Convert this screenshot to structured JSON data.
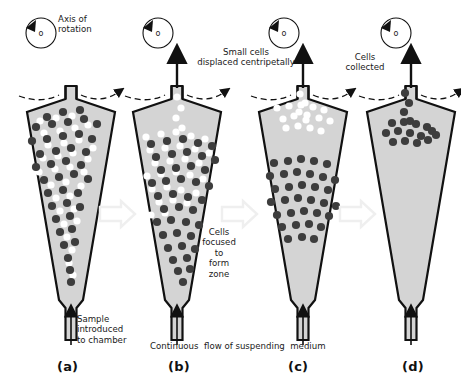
{
  "figure": {
    "title_present": false,
    "background_color": "#ffffff",
    "chamber_fill": "#d4d4d4",
    "chamber_stroke": "#111111",
    "dark_cell_color": "#3d3d3d",
    "light_cell_color": "#ffffff",
    "transition_arrow_color": "#efefef",
    "text_color": "#1a1a1a"
  },
  "rotation_icon": {
    "name": "axis-of-rotation-icon",
    "center_mark": "o",
    "direction": "counterclockwise"
  },
  "annotations": {
    "axis_of_rotation": "Axis of\nrotation",
    "small_cells": "Small cells\ndisplaced centripetally",
    "cells_focused": "Cells\nfocused\nto\nform\nzone",
    "cells_collected": "Cells\ncollected",
    "sample_introduced": "Sample\nintroduced\nto chamber",
    "continuous_flow": "Continuous  flow of suspending  medium"
  },
  "panels": [
    {
      "id": "a",
      "label": "(a)",
      "caption": "Sample introduced to chamber",
      "dark_cells": [
        [
          47,
          117
        ],
        [
          63,
          112
        ],
        [
          80,
          110
        ],
        [
          36,
          127
        ],
        [
          52,
          124
        ],
        [
          68,
          122
        ],
        [
          84,
          119
        ],
        [
          97,
          124
        ],
        [
          32,
          141
        ],
        [
          47,
          139
        ],
        [
          63,
          136
        ],
        [
          79,
          134
        ],
        [
          92,
          139
        ],
        [
          40,
          154
        ],
        [
          56,
          151
        ],
        [
          71,
          148
        ],
        [
          86,
          152
        ],
        [
          36,
          167
        ],
        [
          51,
          164
        ],
        [
          66,
          161
        ],
        [
          81,
          165
        ],
        [
          44,
          180
        ],
        [
          59,
          177
        ],
        [
          74,
          174
        ],
        [
          88,
          179
        ],
        [
          48,
          193
        ],
        [
          63,
          190
        ],
        [
          78,
          193
        ],
        [
          52,
          206
        ],
        [
          67,
          203
        ],
        [
          80,
          207
        ],
        [
          56,
          219
        ],
        [
          70,
          216
        ],
        [
          60,
          232
        ],
        [
          72,
          229
        ],
        [
          64,
          245
        ],
        [
          75,
          242
        ],
        [
          68,
          258
        ],
        [
          70,
          270
        ],
        [
          71,
          282
        ]
      ],
      "light_cells": [
        [
          40,
          121
        ],
        [
          56,
          118
        ],
        [
          72,
          116
        ],
        [
          88,
          125
        ],
        [
          44,
          133
        ],
        [
          60,
          131
        ],
        [
          75,
          128
        ],
        [
          28,
          148
        ],
        [
          48,
          145
        ],
        [
          64,
          143
        ],
        [
          79,
          140
        ],
        [
          93,
          148
        ],
        [
          43,
          158
        ],
        [
          58,
          156
        ],
        [
          73,
          153
        ],
        [
          88,
          159
        ],
        [
          39,
          172
        ],
        [
          55,
          169
        ],
        [
          70,
          167
        ],
        [
          84,
          172
        ],
        [
          51,
          185
        ],
        [
          66,
          182
        ],
        [
          81,
          186
        ],
        [
          56,
          198
        ],
        [
          70,
          196
        ],
        [
          60,
          211
        ],
        [
          74,
          209
        ],
        [
          64,
          224
        ],
        [
          77,
          221
        ],
        [
          67,
          237
        ],
        [
          72,
          250
        ],
        [
          69,
          263
        ],
        [
          73,
          275
        ]
      ]
    },
    {
      "id": "b",
      "label": "(b)",
      "caption": "Continuous flow of suspending medium",
      "dark_cells": [
        [
          151,
          144
        ],
        [
          167,
          141
        ],
        [
          183,
          139
        ],
        [
          198,
          143
        ],
        [
          212,
          146
        ],
        [
          156,
          157
        ],
        [
          172,
          154
        ],
        [
          187,
          152
        ],
        [
          202,
          156
        ],
        [
          215,
          160
        ],
        [
          161,
          170
        ],
        [
          176,
          168
        ],
        [
          191,
          166
        ],
        [
          205,
          170
        ],
        [
          152,
          183
        ],
        [
          166,
          181
        ],
        [
          181,
          179
        ],
        [
          196,
          182
        ],
        [
          209,
          186
        ],
        [
          158,
          196
        ],
        [
          173,
          194
        ],
        [
          188,
          197
        ],
        [
          202,
          200
        ],
        [
          164,
          209
        ],
        [
          179,
          207
        ],
        [
          193,
          210
        ],
        [
          157,
          222
        ],
        [
          171,
          220
        ],
        [
          186,
          222
        ],
        [
          199,
          225
        ],
        [
          163,
          235
        ],
        [
          177,
          233
        ],
        [
          191,
          236
        ],
        [
          168,
          248
        ],
        [
          182,
          246
        ],
        [
          195,
          249
        ],
        [
          173,
          260
        ],
        [
          187,
          258
        ],
        [
          178,
          271
        ],
        [
          190,
          269
        ],
        [
          183,
          282
        ]
      ],
      "light_cells": [
        [
          177,
          97
        ],
        [
          181,
          108
        ],
        [
          176,
          118
        ],
        [
          182,
          128
        ],
        [
          146,
          137
        ],
        [
          161,
          134
        ],
        [
          176,
          132
        ],
        [
          191,
          136
        ],
        [
          205,
          139
        ],
        [
          150,
          150
        ],
        [
          165,
          148
        ],
        [
          180,
          146
        ],
        [
          195,
          149
        ],
        [
          209,
          153
        ],
        [
          155,
          163
        ],
        [
          170,
          161
        ],
        [
          185,
          159
        ],
        [
          199,
          163
        ],
        [
          147,
          176
        ],
        [
          161,
          174
        ],
        [
          176,
          172
        ],
        [
          190,
          175
        ],
        [
          203,
          179
        ],
        [
          152,
          189
        ],
        [
          167,
          187
        ],
        [
          181,
          190
        ],
        [
          196,
          193
        ],
        [
          159,
          202
        ],
        [
          173,
          200
        ],
        [
          187,
          203
        ],
        [
          151,
          215
        ],
        [
          165,
          213
        ]
      ]
    },
    {
      "id": "c",
      "label": "(c)",
      "caption": "Cells focused to form zone",
      "dark_cells": [
        [
          274,
          163
        ],
        [
          288,
          161
        ],
        [
          301,
          159
        ],
        [
          314,
          161
        ],
        [
          327,
          164
        ],
        [
          270,
          176
        ],
        [
          284,
          174
        ],
        [
          297,
          172
        ],
        [
          310,
          174
        ],
        [
          323,
          177
        ],
        [
          335,
          180
        ],
        [
          275,
          189
        ],
        [
          289,
          187
        ],
        [
          302,
          185
        ],
        [
          315,
          187
        ],
        [
          328,
          190
        ],
        [
          271,
          202
        ],
        [
          285,
          200
        ],
        [
          298,
          198
        ],
        [
          311,
          200
        ],
        [
          324,
          203
        ],
        [
          336,
          206
        ],
        [
          277,
          215
        ],
        [
          291,
          213
        ],
        [
          304,
          211
        ],
        [
          317,
          213
        ],
        [
          329,
          216
        ],
        [
          282,
          227
        ],
        [
          296,
          225
        ],
        [
          309,
          224
        ],
        [
          321,
          227
        ],
        [
          288,
          239
        ],
        [
          302,
          237
        ],
        [
          314,
          239
        ]
      ],
      "light_cells": [
        [
          300,
          94
        ],
        [
          305,
          103
        ],
        [
          299,
          112
        ],
        [
          306,
          120
        ],
        [
          283,
          119
        ],
        [
          294,
          116
        ],
        [
          307,
          115
        ],
        [
          319,
          118
        ],
        [
          330,
          121
        ],
        [
          277,
          108
        ],
        [
          289,
          106
        ],
        [
          301,
          105
        ],
        [
          313,
          107
        ],
        [
          324,
          110
        ],
        [
          286,
          128
        ],
        [
          298,
          126
        ],
        [
          310,
          128
        ],
        [
          321,
          131
        ]
      ]
    },
    {
      "id": "d",
      "label": "(d)",
      "caption": "Cells collected",
      "dark_cells": [
        [
          405,
          93
        ],
        [
          409,
          103
        ],
        [
          404,
          112
        ],
        [
          410,
          121
        ],
        [
          392,
          123
        ],
        [
          404,
          122
        ],
        [
          416,
          124
        ],
        [
          427,
          127
        ],
        [
          386,
          133
        ],
        [
          398,
          131
        ],
        [
          410,
          133
        ],
        [
          421,
          136
        ],
        [
          432,
          131
        ],
        [
          393,
          142
        ],
        [
          405,
          141
        ],
        [
          417,
          143
        ],
        [
          428,
          140
        ],
        [
          436,
          135
        ]
      ],
      "light_cells": []
    }
  ]
}
